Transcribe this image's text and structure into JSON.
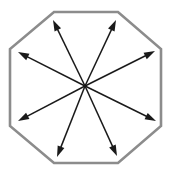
{
  "figure": {
    "kind": "geometry-diagram",
    "canvas": {
      "width": 174,
      "height": 176,
      "background": "#ffffff"
    },
    "center": {
      "label": "center",
      "x": 85,
      "y": 86
    },
    "shape": {
      "name": "octagon",
      "sides": 8,
      "stroke_color": "#8c8c8c",
      "fill_color": "#ffffff",
      "stroke_width": 2.6,
      "points_attr": "54,12 118,12 161,49 161,126 118,163 54,163 10,126 10,49",
      "vertices": [
        {
          "name": "top-left-corner",
          "x": 54,
          "y": 12
        },
        {
          "name": "top-right-corner",
          "x": 118,
          "y": 12
        },
        {
          "name": "right-top-corner",
          "x": 161,
          "y": 49
        },
        {
          "name": "right-bottom-corner",
          "x": 161,
          "y": 126
        },
        {
          "name": "bottom-right-corner",
          "x": 118,
          "y": 163
        },
        {
          "name": "bottom-left-corner",
          "x": 54,
          "y": 163
        },
        {
          "name": "left-bottom-corner",
          "x": 10,
          "y": 126
        },
        {
          "name": "left-top-corner",
          "x": 10,
          "y": 49
        }
      ]
    },
    "arrows": {
      "count": 8,
      "color": "#1a1a1a",
      "stroke_width": 1.5,
      "head_length": 11,
      "head_half_width": 3.6,
      "items": [
        {
          "name": "arrow-up-left",
          "direction": "up-left",
          "tip_x": 53,
          "tip_y": 20
        },
        {
          "name": "arrow-up-right",
          "direction": "up-right",
          "tip_x": 116,
          "tip_y": 20
        },
        {
          "name": "arrow-right-up",
          "direction": "right-up",
          "tip_x": 155,
          "tip_y": 51
        },
        {
          "name": "arrow-right-down",
          "direction": "right-down",
          "tip_x": 156,
          "tip_y": 121
        },
        {
          "name": "arrow-down-right",
          "direction": "down-right",
          "tip_x": 117,
          "tip_y": 156
        },
        {
          "name": "arrow-down-left",
          "direction": "down-left",
          "tip_x": 57,
          "tip_y": 157
        },
        {
          "name": "arrow-left-down",
          "direction": "left-down",
          "tip_x": 18,
          "tip_y": 121
        },
        {
          "name": "arrow-left-up",
          "direction": "left-up",
          "tip_x": 18,
          "tip_y": 52
        }
      ]
    }
  }
}
